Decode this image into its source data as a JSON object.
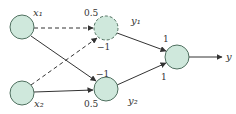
{
  "diagram": {
    "type": "neural-network",
    "node_fill": "#cfe8dc",
    "node_stroke": "#4f6f5f",
    "edge_color": "#333333",
    "nodes": [
      {
        "id": "x1",
        "label": "x₁",
        "role": "input"
      },
      {
        "id": "x2",
        "label": "x₂",
        "role": "input"
      },
      {
        "id": "y1",
        "label": "y₁",
        "role": "hidden",
        "style": "dashed"
      },
      {
        "id": "y2",
        "label": "y₂",
        "role": "hidden",
        "style": "solid"
      },
      {
        "id": "out",
        "label": "",
        "role": "output"
      }
    ],
    "edges": [
      {
        "from": "x1",
        "to": "y1",
        "weight": "0.5",
        "style": "dashed"
      },
      {
        "from": "x2",
        "to": "y1",
        "weight": "−1",
        "style": "dashed"
      },
      {
        "from": "x1",
        "to": "y2",
        "weight": "−1",
        "style": "solid"
      },
      {
        "from": "x2",
        "to": "y2",
        "weight": "0.5",
        "style": "solid"
      },
      {
        "from": "y1",
        "to": "out",
        "weight": "1",
        "style": "solid"
      },
      {
        "from": "y2",
        "to": "out",
        "weight": "1",
        "style": "solid"
      }
    ],
    "output_label": "y"
  }
}
